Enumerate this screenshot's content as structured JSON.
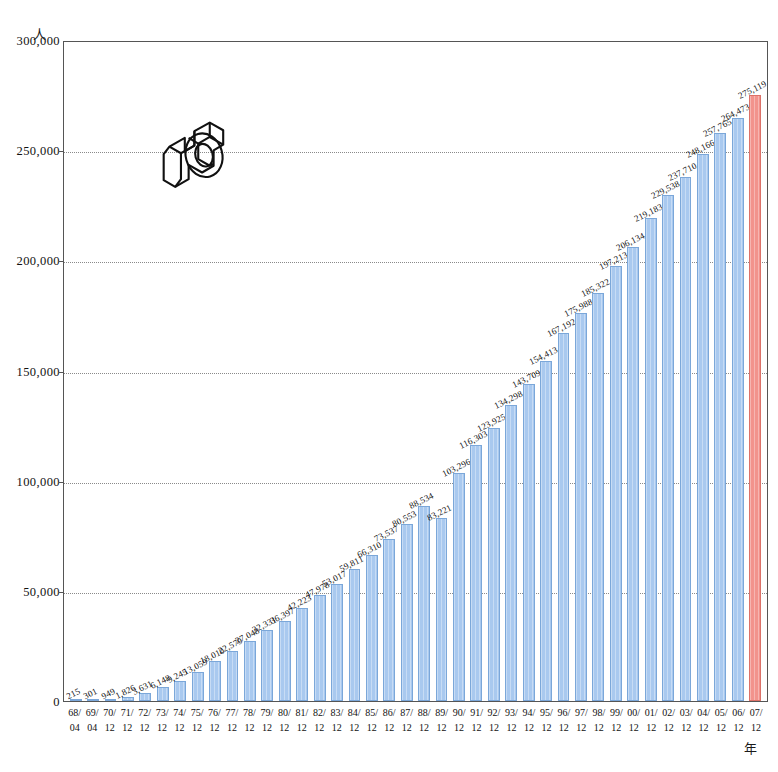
{
  "chart_data": {
    "type": "bar",
    "title": "",
    "xlabel": "年",
    "ylabel": "人",
    "ylim": [
      0,
      300000
    ],
    "ytick_values": [
      300000,
      250000,
      200000,
      150000,
      100000,
      50000,
      0
    ],
    "ytick_labels": [
      "300,000",
      "250,000",
      "200,000",
      "150,000",
      "100,000",
      "50,000",
      "0"
    ],
    "grid": "horizontal-dotted",
    "legend": "none",
    "categories": [
      "68/04",
      "69/04",
      "70/12",
      "71/12",
      "72/12",
      "73/12",
      "74/12",
      "75/12",
      "76/12",
      "77/12",
      "78/12",
      "79/12",
      "80/12",
      "81/12",
      "82/12",
      "83/12",
      "84/12",
      "85/12",
      "86/12",
      "87/12",
      "88/12",
      "89/12",
      "90/12",
      "91/12",
      "92/12",
      "93/12",
      "94/12",
      "95/12",
      "96/12",
      "97/12",
      "98/12",
      "99/12",
      "00/12",
      "01/12",
      "02/12",
      "03/12",
      "04/12",
      "05/12",
      "06/12",
      "07/12"
    ],
    "values": [
      215,
      301,
      949,
      1826,
      3631,
      6148,
      9245,
      13059,
      18010,
      22579,
      27048,
      32331,
      36397,
      42223,
      47978,
      53017,
      59811,
      66310,
      73537,
      80553,
      88534,
      83221,
      103296,
      116303,
      123925,
      134298,
      143709,
      154413,
      167192,
      175988,
      185322,
      197213,
      206134,
      219183,
      229538,
      237710,
      248166,
      257765,
      264473,
      275119
    ],
    "value_labels": [
      "215",
      "301",
      "949",
      "1,826",
      "3,631",
      "6,148",
      "9,245",
      "13,059",
      "18,010",
      "22,579",
      "27,048",
      "32,331",
      "36,397",
      "42,223",
      "47,978",
      "53,017",
      "59,811",
      "66,310",
      "73,537",
      "80,553",
      "88,534",
      "83,221",
      "103,296",
      "116,303",
      "123,925",
      "134,298",
      "143,709",
      "154,413",
      "167,192",
      "175,988",
      "185,322",
      "197,213",
      "206,134",
      "219,183",
      "229,538",
      "237,710",
      "248,166",
      "257,765",
      "264,473",
      "275,119"
    ],
    "highlight_index": 39,
    "colors": {
      "bar": "#a9c9ef",
      "bar_border": "#7ba7d9",
      "bar_highlight": "#f2938c",
      "bar_highlight_border": "#dc7168",
      "grid": "#8a8a8a",
      "axis": "#555555",
      "text": "#111111"
    }
  },
  "axis": {
    "y_unit": "人",
    "x_unit": "年"
  },
  "logo": {
    "name": "isometric-3d-logo"
  }
}
